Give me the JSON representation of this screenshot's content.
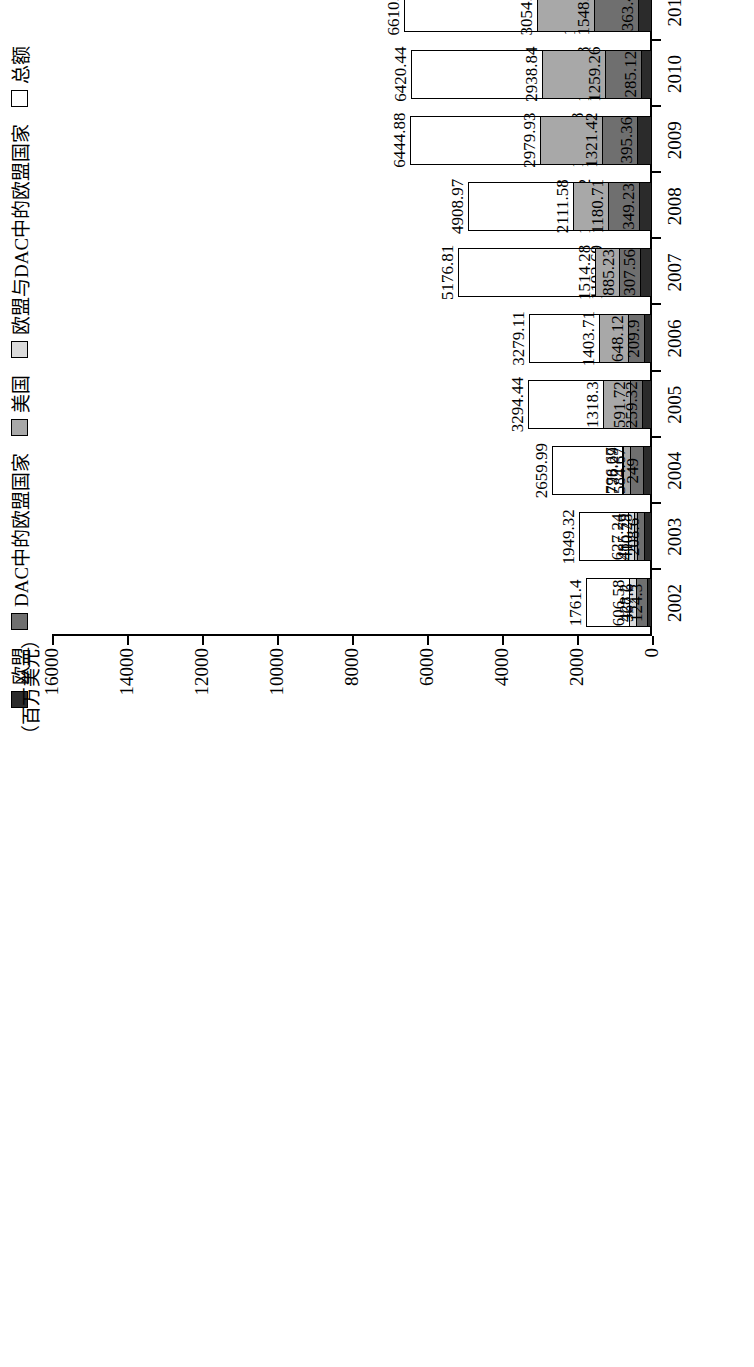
{
  "chart_data": {
    "type": "bar",
    "stacked": false,
    "orientation": "vertical",
    "title": "",
    "xlabel": "（年份）",
    "ylabel": "（百万美元）",
    "ylim": [
      0,
      16000
    ],
    "ytick_labels": [
      "0",
      "2000",
      "4000",
      "6000",
      "8000",
      "10000",
      "12000",
      "14000",
      "16000"
    ],
    "ytick_values": [
      0,
      2000,
      4000,
      6000,
      8000,
      10000,
      12000,
      14000,
      16000
    ],
    "grid": false,
    "legend_position": "top-left",
    "categories": [
      "2002",
      "2003",
      "2004",
      "2005",
      "2006",
      "2007",
      "2008",
      "2009",
      "2010",
      "2011",
      "2012",
      "2013",
      "2014",
      "2015",
      "2016",
      "2017",
      "2018",
      "2019"
    ],
    "series": [
      {
        "name": "欧盟",
        "key": "eu",
        "color": "#2b2b2b",
        "values": [
          124.3,
          208.6,
          249.0,
          259.32,
          209.9,
          307.56,
          349.23,
          395.36,
          285.12,
          363.47,
          230.6,
          250.14,
          358.9,
          192.28,
          399.81,
          418.6,
          460.75,
          415.51
        ]
      },
      {
        "name": "DAC中的欧盟国家",
        "key": "dac_eu",
        "color": "#6f6f6f",
        "values": [
          428.2,
          410.28,
          584.67,
          591.72,
          648.12,
          885.23,
          1180.71,
          1321.42,
          1259.26,
          1548.86,
          1438.3,
          1335.06,
          1256.53,
          1229.88,
          1145.9,
          1110.91,
          1192.28,
          1143.99
        ]
      },
      {
        "name": "美国",
        "key": "usa",
        "color": "#a8a8a8",
        "values": [
          367.6,
          485.79,
          778.29,
          1318.3,
          1403.71,
          1514.28,
          2111.58,
          2979.93,
          2938.84,
          3054.95,
          2714.09,
          1694.07,
          1928.08,
          1631.47,
          1375.76,
          1215.11,
          914.37,
          1428.21
        ]
      },
      {
        "name": "欧盟与DAC中的欧盟国家",
        "key": "eu_and_dac_eu",
        "color": "#dcdcdc",
        "values": [
          606.58,
          627.24,
          796.67,
          848.34,
          869.02,
          1192.69,
          1530.02,
          1716.78,
          1544.28,
          1912.33,
          1694.9,
          1585.2,
          1615.43,
          1422.16,
          1545.71,
          1525.77,
          1653.03,
          1559.5
        ]
      },
      {
        "name": "总额",
        "key": "total",
        "color": "#ffffff",
        "values": [
          1761.4,
          1949.32,
          2659.99,
          3294.44,
          3279.11,
          5176.81,
          4908.97,
          6444.88,
          6420.44,
          6610.44,
          6487.2,
          4981.84,
          4795.05,
          4448.77,
          4247.03,
          3909.39,
          3728.59,
          4139.62
        ]
      }
    ],
    "legend": [
      {
        "label": "欧盟",
        "color": "#2b2b2b"
      },
      {
        "label": "DAC中的欧盟国家",
        "color": "#6f6f6f"
      },
      {
        "label": "美国",
        "color": "#a8a8a8"
      },
      {
        "label": "欧盟与DAC中的欧盟国家",
        "color": "#dcdcdc"
      },
      {
        "label": "总额",
        "color": "#ffffff"
      }
    ]
  }
}
